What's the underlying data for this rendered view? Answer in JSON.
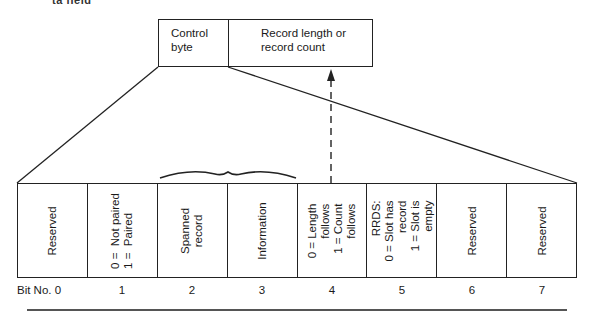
{
  "fragment_top": "ta field",
  "top_boxes": {
    "control": "Control\nbyte",
    "record": "Record length or\nrecord count"
  },
  "cells": [
    {
      "bit": "Bit No. 0",
      "text": "Reserved"
    },
    {
      "bit": "1",
      "text": "0 =  Not paired\n1 =  Paired"
    },
    {
      "bit": "2",
      "text": "Spanned\nrecord"
    },
    {
      "bit": "3",
      "text": "Information"
    },
    {
      "bit": "4",
      "text": "0 = Length\nfollows\n1 = Count\nfollows"
    },
    {
      "bit": "5",
      "text": "RRDS:\n0 = Slot has\nrecord\n1 = Slot is\nempty"
    },
    {
      "bit": "6",
      "text": "Reserved"
    },
    {
      "bit": "7",
      "text": "Reserved"
    }
  ],
  "colors": {
    "line": "#222222",
    "background": "#ffffff"
  }
}
